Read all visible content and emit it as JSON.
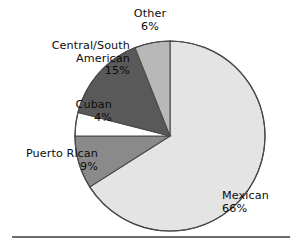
{
  "figure": {
    "name": "hispanic-origin-pie-chart",
    "background_color": "#ffffff",
    "rule_color": "#6b6b6b"
  },
  "chart_data": {
    "type": "pie",
    "title": "",
    "subtitle": "",
    "xlabel": "",
    "ylabel": "",
    "legend_position": "none",
    "grid": false,
    "start_angle_deg": 0,
    "direction": "clockwise",
    "units": "percent",
    "categories": [
      "Mexican",
      "Puerto Rican",
      "Cuban",
      "Central/South American",
      "Other"
    ],
    "values": [
      66,
      9,
      4,
      15,
      6
    ],
    "labels": [
      "66%",
      "9%",
      "4%",
      "15%",
      "6%"
    ],
    "colors": [
      "#e4e4e4",
      "#8a8a8a",
      "#ffffff",
      "#595959",
      "#b8b8b8"
    ],
    "slices": [
      {
        "name": "Mexican",
        "value": 66,
        "label": "Mexican",
        "percent_label": "66%",
        "color": "#e4e4e4",
        "start_deg": 0,
        "end_deg": 237.6
      },
      {
        "name": "Puerto Rican",
        "value": 9,
        "label": "Puerto Rican",
        "percent_label": "9%",
        "color": "#8a8a8a",
        "start_deg": 237.6,
        "end_deg": 270.0
      },
      {
        "name": "Cuban",
        "value": 4,
        "label": "Cuban",
        "percent_label": "4%",
        "color": "#ffffff",
        "start_deg": 270.0,
        "end_deg": 284.4
      },
      {
        "name": "Central/South American",
        "value": 15,
        "label_line1": "Central/South",
        "label_line2": "American",
        "percent_label": "15%",
        "color": "#595959",
        "start_deg": 284.4,
        "end_deg": 338.4
      },
      {
        "name": "Other",
        "value": 6,
        "label": "Other",
        "percent_label": "6%",
        "color": "#b8b8b8",
        "start_deg": 338.4,
        "end_deg": 360.0
      }
    ]
  }
}
